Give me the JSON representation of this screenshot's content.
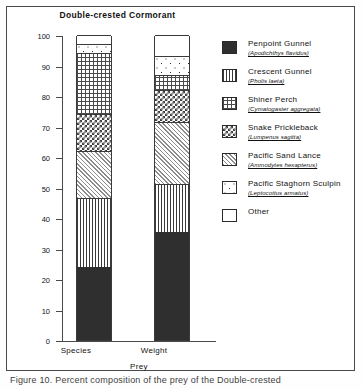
{
  "figure": {
    "title": "Double-crested Cormorant",
    "caption": "Figure 10.  Percent composition of the prey of the Double-crested"
  },
  "axes": {
    "ylabel": "Percent",
    "xlabel": "Prey",
    "yticks": [
      "0",
      "10",
      "20",
      "30",
      "40",
      "50",
      "60",
      "70",
      "80",
      "90",
      "100"
    ],
    "xticks": [
      "Species",
      "Weight"
    ]
  },
  "legend": [
    {
      "name": "Penpoint Gunnel",
      "scientific": "(Apodichthys flavidus)",
      "pattern": "solid-dark",
      "swatch": "p-solid"
    },
    {
      "name": "Crescent Gunnel",
      "scientific": "(Pholis laeta)",
      "pattern": "vertical-stripes",
      "swatch": "p-vstripe"
    },
    {
      "name": "Shiner Perch",
      "scientific": "(Cymatogaster aggregata)",
      "pattern": "dot-grid",
      "swatch": "p-dotgrid"
    },
    {
      "name": "Snake Prickleback",
      "scientific": "(Lumpenus sagitta)",
      "pattern": "checkerboard",
      "swatch": "p-check"
    },
    {
      "name": "Pacific Sand Lance",
      "scientific": "(Ammodytes hexapterus)",
      "pattern": "light-hatch",
      "swatch": "p-light"
    },
    {
      "name": "Pacific Staghorn Sculpin",
      "scientific": "(Leptocottus armatus)",
      "pattern": "sparse-dots",
      "swatch": "p-sparse"
    },
    {
      "name": "Other",
      "scientific": "",
      "pattern": "empty-white",
      "swatch": "p-empty"
    }
  ],
  "chart_data": {
    "type": "bar",
    "subtype": "stacked-percent",
    "title": "Double-crested Cormorant",
    "xlabel": "Prey",
    "ylabel": "Percent",
    "ylim": [
      0,
      100
    ],
    "ytick_step": 10,
    "grid": false,
    "legend_position": "right",
    "categories": [
      "Species",
      "Weight"
    ],
    "series": [
      {
        "name": "Penpoint Gunnel",
        "values": [
          24.0,
          35.5
        ]
      },
      {
        "name": "Crescent Gunnel",
        "values": [
          22.5,
          15.5
        ]
      },
      {
        "name": "Pacific Sand Lance",
        "values": [
          15.5,
          20.5
        ]
      },
      {
        "name": "Snake Prickleback",
        "values": [
          12.0,
          10.5
        ]
      },
      {
        "name": "Shiner Perch",
        "values": [
          20.0,
          5.0
        ]
      },
      {
        "name": "Pacific Staghorn Sculpin",
        "values": [
          3.0,
          6.0
        ]
      },
      {
        "name": "Other",
        "values": [
          3.0,
          7.0
        ]
      }
    ],
    "stack_order_bottom_to_top": [
      "Penpoint Gunnel",
      "Crescent Gunnel",
      "Pacific Sand Lance",
      "Snake Prickleback",
      "Shiner Perch",
      "Pacific Staghorn Sculpin",
      "Other"
    ],
    "cumulative_tops": {
      "Species": [
        24.0,
        46.5,
        62.0,
        74.0,
        94.0,
        97.0,
        100.0
      ],
      "Weight": [
        35.5,
        51.0,
        71.5,
        82.0,
        87.0,
        93.0,
        100.0
      ]
    }
  },
  "colors": {
    "axis": "#4a4a4a",
    "text": "#111111",
    "dark_fill": "#2f2f2f",
    "background": "#ffffff"
  }
}
